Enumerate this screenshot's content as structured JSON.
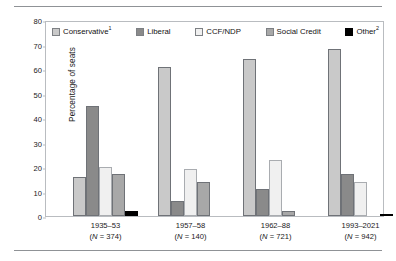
{
  "chart_data": {
    "type": "bar",
    "title": "",
    "subtitle": "",
    "xlabel": "",
    "ylabel": "Percentage of seats",
    "ylim": [
      0,
      80
    ],
    "yticks": [
      0,
      10,
      20,
      30,
      40,
      50,
      60,
      70,
      80
    ],
    "grid": false,
    "legend_position": "top-inside",
    "categories": [
      "1935–53",
      "1957–58",
      "1962–88",
      "1993–2021"
    ],
    "category_sublabels": [
      "(N = 374)",
      "(N = 140)",
      "(N = 721)",
      "(N = 942)"
    ],
    "category_n": [
      374,
      140,
      721,
      942
    ],
    "series": [
      {
        "name": "Conservative¹",
        "plain_name": "Conservative",
        "color": "#c9c9c9",
        "values": [
          16,
          61,
          64,
          68
        ]
      },
      {
        "name": "Liberal",
        "plain_name": "Liberal",
        "color": "#8a8a8a",
        "values": [
          45,
          6,
          11,
          17
        ]
      },
      {
        "name": "CCF/NDP",
        "plain_name": "CCF/NDP",
        "color": "#f0f0f0",
        "values": [
          20,
          19,
          23,
          14
        ]
      },
      {
        "name": "Social Credit",
        "plain_name": "Social Credit",
        "color": "#a8a8a8",
        "values": [
          17,
          14,
          2,
          0
        ]
      },
      {
        "name": "Other²",
        "plain_name": "Other",
        "color": "#000000",
        "values": [
          2,
          0,
          0,
          1
        ]
      }
    ]
  },
  "axis": {
    "y_label": "Percentage of seats",
    "y_tick_labels": [
      "80",
      "70",
      "60",
      "50",
      "40",
      "30",
      "20",
      "10",
      "0"
    ]
  },
  "legend": {
    "items": [
      {
        "label": "Conservative",
        "superscript": "1"
      },
      {
        "label": "Liberal",
        "superscript": ""
      },
      {
        "label": "CCF/NDP",
        "superscript": ""
      },
      {
        "label": "Social Credit",
        "superscript": ""
      },
      {
        "label": "Other",
        "superscript": "2"
      }
    ]
  },
  "x_axis": {
    "groups": [
      {
        "period": "1935–53",
        "n_label": "(N = 374)",
        "n_prefix": "(",
        "n_var": "N",
        "n_eq": " = 374)"
      },
      {
        "period": "1957–58",
        "n_label": "(N = 140)",
        "n_prefix": "(",
        "n_var": "N",
        "n_eq": " = 140)"
      },
      {
        "period": "1962–88",
        "n_label": "(N = 721)",
        "n_prefix": "(",
        "n_var": "N",
        "n_eq": " = 721)"
      },
      {
        "period": "1993–2021",
        "n_label": "(N = 942)",
        "n_prefix": "(",
        "n_var": "N",
        "n_eq": " = 942)"
      }
    ]
  },
  "colors": {
    "conservative": "#c9c9c9",
    "liberal": "#8a8a8a",
    "ccf_ndp": "#f0f0f0",
    "social_credit": "#a8a8a8",
    "other": "#000000",
    "frame": "#b9bcc0",
    "rule": "#8f9296"
  }
}
